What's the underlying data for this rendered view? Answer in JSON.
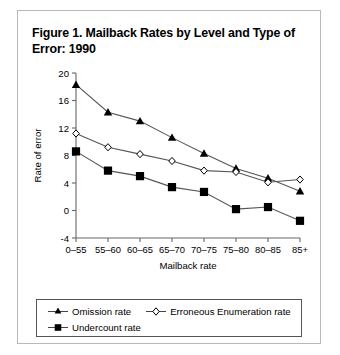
{
  "figure": {
    "title": "Figure 1. Mailback Rates by Level and Type of Error: 1990"
  },
  "chart_data": {
    "type": "line",
    "title": "Figure 1. Mailback Rates by Level and Type of Error: 1990",
    "xlabel": "Mailback rate",
    "ylabel": "Rate of error",
    "categories": [
      "0–55",
      "55–60",
      "60–65",
      "65–70",
      "70–75",
      "75–80",
      "80–85",
      "85+"
    ],
    "ylim": [
      -4,
      20
    ],
    "yticks": [
      -4,
      0,
      4,
      8,
      12,
      16,
      20
    ],
    "ytick_labels": [
      "-4",
      "0",
      "4",
      "8",
      "12",
      "16",
      "20"
    ],
    "grid": false,
    "legend_position": "below",
    "series": [
      {
        "name": "Omission rate",
        "marker": "filled-triangle",
        "values": [
          18.3,
          14.3,
          13.0,
          10.6,
          8.3,
          6.1,
          4.7,
          2.8
        ]
      },
      {
        "name": "Erroneous Enumeration rate",
        "marker": "open-diamond",
        "values": [
          11.2,
          9.2,
          8.2,
          7.2,
          5.8,
          5.6,
          4.1,
          4.5
        ]
      },
      {
        "name": "Undercount rate",
        "marker": "filled-square",
        "values": [
          8.6,
          5.8,
          5.0,
          3.4,
          2.7,
          0.2,
          0.5,
          -1.5
        ]
      }
    ]
  },
  "legend": {
    "items": [
      {
        "label": "Omission rate",
        "marker": "filled-triangle"
      },
      {
        "label": "Erroneous Enumeration rate",
        "marker": "open-diamond"
      },
      {
        "label": "Undercount rate",
        "marker": "filled-square"
      }
    ]
  },
  "colors": {
    "line": "#555555",
    "marker": "#000000",
    "axis": "#666666",
    "card_border": "#b9b9b9"
  }
}
